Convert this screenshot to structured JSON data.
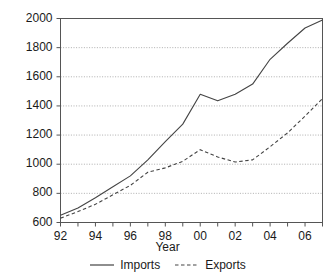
{
  "chart_data": {
    "type": "line",
    "title": "",
    "xlabel": "Year",
    "ylabel": "",
    "x": [
      92,
      93,
      94,
      95,
      96,
      97,
      98,
      99,
      "00",
      "01",
      "02",
      "03",
      "04",
      "05",
      "06",
      "07"
    ],
    "x_ticks_major": [
      "92",
      "94",
      "96",
      "98",
      "00",
      "02",
      "04",
      "06"
    ],
    "y_ticks": [
      600,
      800,
      1000,
      1200,
      1400,
      1600,
      1800,
      2000
    ],
    "xlim": [
      1992,
      2007
    ],
    "ylim": [
      600,
      2000
    ],
    "grid": true,
    "legend_position": "bottom",
    "series": [
      {
        "name": "Imports",
        "style": "solid",
        "color": "#444444",
        "values": [
          650,
          700,
          770,
          845,
          920,
          1030,
          1155,
          1275,
          1480,
          1435,
          1480,
          1550,
          1720,
          1830,
          1935,
          1990
        ]
      },
      {
        "name": "Exports",
        "style": "dashed",
        "color": "#444444",
        "values": [
          630,
          675,
          725,
          790,
          855,
          945,
          975,
          1020,
          1100,
          1050,
          1015,
          1030,
          1120,
          1215,
          1330,
          1450
        ]
      }
    ]
  },
  "axes": {
    "y_labels": [
      "2000",
      "1800",
      "1600",
      "1400",
      "1200",
      "1000",
      "800",
      "600"
    ],
    "x_labels": [
      "92",
      "94",
      "96",
      "98",
      "00",
      "02",
      "04",
      "06"
    ],
    "x_title": "Year"
  },
  "legend": {
    "items": [
      {
        "label": "Imports",
        "style": "solid"
      },
      {
        "label": "Exports",
        "style": "dashed"
      }
    ]
  }
}
